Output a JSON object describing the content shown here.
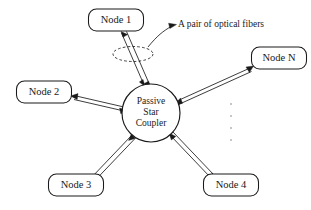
{
  "diagram": {
    "coupler": {
      "name": "passive-star-coupler",
      "line1": "Passive",
      "line2": "Star",
      "line3": "Coupler",
      "cx": 151,
      "cy": 113,
      "r": 29
    },
    "nodes": [
      {
        "id": "node-1",
        "label": "Node 1",
        "x": 116,
        "y": 20,
        "w": 55,
        "h": 22
      },
      {
        "id": "node-2",
        "label": "Node 2",
        "x": 44,
        "y": 92,
        "w": 55,
        "h": 22
      },
      {
        "id": "node-3",
        "label": "Node 3",
        "x": 76,
        "y": 185,
        "w": 55,
        "h": 22
      },
      {
        "id": "node-4",
        "label": "Node 4",
        "x": 231,
        "y": 185,
        "w": 55,
        "h": 22
      },
      {
        "id": "node-n",
        "label": "Node N",
        "x": 279,
        "y": 58,
        "w": 55,
        "h": 22
      }
    ],
    "annotation": {
      "name": "optical-fiber-pair-callout",
      "text": "A pair of optical fibers",
      "x": 178,
      "y": 25
    },
    "ellipsis": {
      "name": "more-nodes-ellipsis",
      "glyph": "vertical-dots",
      "count": 4
    },
    "colors": {
      "ink": "#1a1a1a",
      "paper": "#ffffff",
      "faint": "#b9b9b9"
    }
  }
}
